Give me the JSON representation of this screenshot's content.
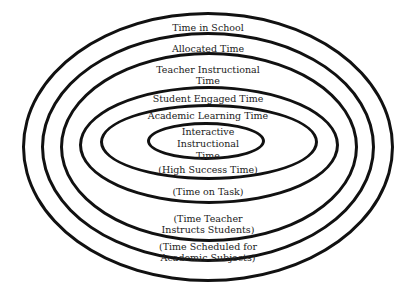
{
  "diagram": {
    "type": "nested-ellipses",
    "stroke_color": "#111111",
    "background": "#ffffff",
    "layers": [
      {
        "name": "time-in-school",
        "top_label": [
          "Time in School"
        ],
        "bottom_label": []
      },
      {
        "name": "allocated-time",
        "top_label": [
          "Allocated Time"
        ],
        "bottom_label": [
          "(Time Scheduled for",
          "Academic Subjects)"
        ]
      },
      {
        "name": "teacher-instructional-time",
        "top_label": [
          "Teacher Instructional",
          "Time"
        ],
        "bottom_label": [
          "(Time Teacher",
          "Instructs Students)"
        ]
      },
      {
        "name": "student-engaged-time",
        "top_label": [
          "Student Engaged Time"
        ],
        "bottom_label": [
          "(Time on Task)"
        ]
      },
      {
        "name": "academic-learning-time",
        "top_label": [
          "Academic Learning Time"
        ],
        "bottom_label": [
          "(High Success Time)"
        ]
      },
      {
        "name": "interactive-instructional-time",
        "top_label": [
          "Interactive",
          "Instructional",
          "Time"
        ],
        "bottom_label": []
      }
    ]
  }
}
